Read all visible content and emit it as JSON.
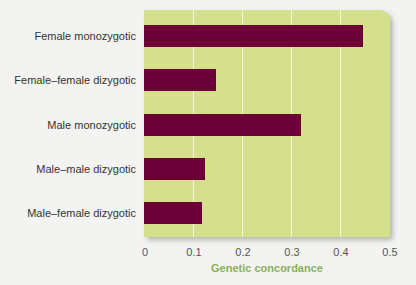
{
  "chart_data": {
    "type": "bar",
    "orientation": "horizontal",
    "title": "",
    "xlabel": "Genetic concordance",
    "ylabel": "",
    "xlim": [
      0,
      0.5
    ],
    "xticks": [
      "0",
      "0.1",
      "0.2",
      "0.3",
      "0.4",
      "0.5"
    ],
    "grid": true,
    "categories": [
      "Female monozygotic",
      "Female–female dizygotic",
      "Male monozygotic",
      "Male–male dizygotic",
      "Male–female dizygotic"
    ],
    "values": [
      0.445,
      0.147,
      0.32,
      0.124,
      0.118
    ],
    "colors": {
      "bar": "#6a0036",
      "plot_bg": "#d4e08c",
      "xlabel": "#8ab05a"
    }
  }
}
